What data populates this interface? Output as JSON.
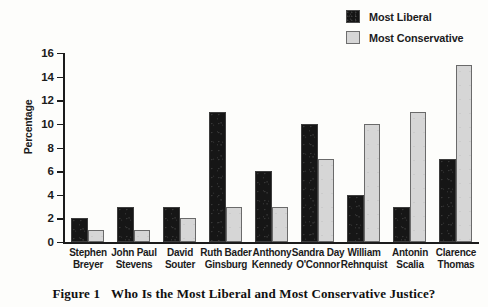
{
  "chart_data": {
    "type": "bar",
    "title": "Who Is the Most Liberal and Most Conservative Justice?",
    "xlabel": "",
    "ylabel": "Percentage",
    "ylim": [
      0,
      16
    ],
    "yticks": [
      0,
      2,
      4,
      6,
      8,
      10,
      12,
      14,
      16
    ],
    "grid": false,
    "legend_position": "top-right",
    "categories": [
      "Stephen Breyer",
      "John Paul Stevens",
      "David Souter",
      "Ruth Bader Ginsburg",
      "Anthony Kennedy",
      "Sandra Day O'Connor",
      "William Rehnquist",
      "Antonin Scalia",
      "Clarence Thomas"
    ],
    "category_lines": [
      [
        "Stephen",
        "Breyer"
      ],
      [
        "John Paul",
        "Stevens"
      ],
      [
        "David",
        "Souter"
      ],
      [
        "Ruth Bader",
        "Ginsburg"
      ],
      [
        "Anthony",
        "Kennedy"
      ],
      [
        "Sandra Day",
        "O'Connor"
      ],
      [
        "William",
        "Rehnquist"
      ],
      [
        "Antonin",
        "Scalia"
      ],
      [
        "Clarence",
        "Thomas"
      ]
    ],
    "series": [
      {
        "name": "Most Liberal",
        "color": "#161616",
        "values": [
          2,
          3,
          3,
          11,
          6,
          10,
          4,
          3,
          7
        ]
      },
      {
        "name": "Most Conservative",
        "color": "#d6d6d6",
        "values": [
          1,
          1,
          2,
          3,
          3,
          7,
          10,
          11,
          15
        ]
      }
    ]
  },
  "legend": {
    "items": [
      {
        "label": "Most Liberal",
        "swatch": "dark"
      },
      {
        "label": "Most Conservative",
        "swatch": "light"
      }
    ]
  },
  "caption": {
    "figure_number": "Figure 1",
    "text": "Who Is the Most Liberal and Most Conservative Justice?"
  }
}
